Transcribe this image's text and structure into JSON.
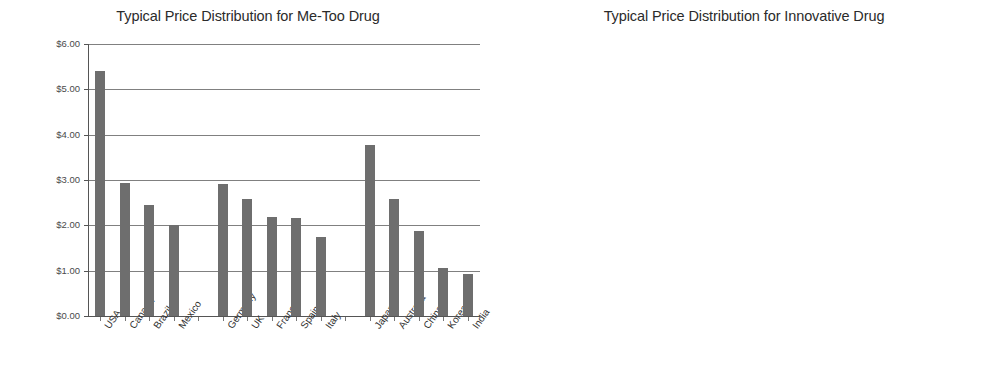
{
  "charts": [
    {
      "title": "Typical Price Distribution for Me-Too Drug",
      "ylim": [
        0,
        6
      ],
      "ytick_step": 1,
      "ytick_labels": [
        "$0.00",
        "$1.00",
        "$2.00",
        "$3.00",
        "$4.00",
        "$5.00",
        "$6.00"
      ],
      "bar_color": "#6e6e6e",
      "categories": [
        "USA",
        "Canada",
        "Brazil",
        "Mexico",
        "",
        "Germany",
        "UK",
        "France",
        "Spain",
        "Italy",
        "",
        "Japan",
        "Australia",
        "China",
        "Korea",
        "India"
      ],
      "values": [
        5.4,
        2.93,
        2.45,
        2.0,
        null,
        2.92,
        2.58,
        2.19,
        2.16,
        1.74,
        null,
        3.78,
        2.58,
        1.88,
        1.05,
        0.93
      ]
    },
    {
      "title": "Typical Price Distribution for Innovative Drug",
      "ylim": [
        0,
        180
      ],
      "ytick_step": 20,
      "ytick_labels": [
        "$0.00",
        "$20.00",
        "$40.00",
        "$60.00",
        "$80.00",
        "$100.00",
        "$120.00",
        "$140.00",
        "$160.00",
        "$180.00"
      ],
      "bar_color": "#6e6e6e",
      "categories": [
        "USA",
        "Canada",
        "Brazil",
        "Mexico",
        "",
        "Germany",
        "UK",
        "France",
        "Spain",
        "Italy",
        "",
        "Japan",
        "Australia",
        "China",
        "Korea",
        "India"
      ],
      "values": [
        144,
        121.5,
        114,
        111,
        null,
        159.5,
        145.5,
        129,
        121,
        119.5,
        null,
        175,
        107,
        107,
        96,
        93.5
      ]
    }
  ],
  "chart_data": [
    {
      "type": "bar",
      "title": "Typical Price Distribution for Me-Too Drug",
      "xlabel": "",
      "ylabel": "",
      "ylim": [
        0,
        6
      ],
      "grid": true,
      "legend": "none",
      "categories": [
        "USA",
        "Canada",
        "Brazil",
        "Mexico",
        "Germany",
        "UK",
        "France",
        "Spain",
        "Italy",
        "Japan",
        "Australia",
        "China",
        "Korea",
        "India"
      ],
      "values": [
        5.4,
        2.93,
        2.45,
        2.0,
        2.92,
        2.58,
        2.19,
        2.16,
        1.74,
        3.78,
        2.58,
        1.88,
        1.05,
        0.93
      ],
      "tick_labels": [
        "$0.00",
        "$1.00",
        "$2.00",
        "$3.00",
        "$4.00",
        "$5.00",
        "$6.00"
      ]
    },
    {
      "type": "bar",
      "title": "Typical Price Distribution for Innovative Drug",
      "xlabel": "",
      "ylabel": "",
      "ylim": [
        0,
        180
      ],
      "grid": true,
      "legend": "none",
      "categories": [
        "USA",
        "Canada",
        "Brazil",
        "Mexico",
        "Germany",
        "UK",
        "France",
        "Spain",
        "Italy",
        "Japan",
        "Australia",
        "China",
        "Korea",
        "India"
      ],
      "values": [
        144,
        121.5,
        114,
        111,
        159.5,
        145.5,
        129,
        121,
        119.5,
        175,
        107,
        107,
        96,
        93.5
      ],
      "tick_labels": [
        "$0.00",
        "$20.00",
        "$40.00",
        "$60.00",
        "$80.00",
        "$100.00",
        "$120.00",
        "$140.00",
        "$160.00",
        "$180.00"
      ]
    }
  ]
}
